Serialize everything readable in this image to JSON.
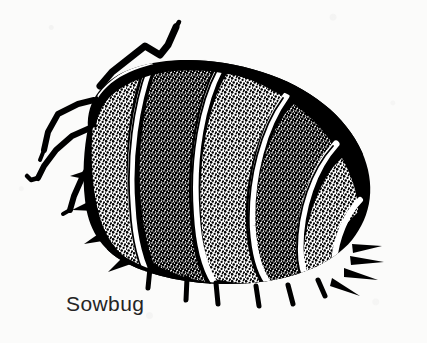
{
  "figure": {
    "caption": "Sowbug",
    "subject": "sowbug",
    "style": "black-and-white stippled line illustration",
    "background_color": "#fbfbfa",
    "ink_color": "#000000",
    "caption_color": "#242424",
    "canvas": {
      "width": 427,
      "height": 343
    }
  },
  "anatomy": {
    "antenna_label": "antenna",
    "head_label": "head",
    "body_label": "segmented-body",
    "legs_label": "legs",
    "tail_label": "uropods",
    "segment_count": 7,
    "visible_leg_count": 7,
    "tail_spike_count": 4
  }
}
